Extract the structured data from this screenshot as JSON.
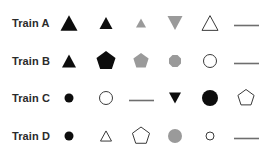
{
  "panel": {
    "name": "marker-legend",
    "background_color": "#ffffff"
  },
  "colors": {
    "black": "#0d0d0d",
    "gray": "#9a9a9a",
    "gray_dark": "#808080",
    "outline": "#3a3a3a",
    "white": "#ffffff",
    "label_text": "#2b2b2b",
    "line_gray": "#6e6e6e"
  },
  "rows": [
    {
      "label": "Train A",
      "markers": [
        {
          "icon": "triangle-up-filled-icon",
          "shape": "triangle-up",
          "fill": "#0d0d0d",
          "stroke": "none",
          "size": 17
        },
        {
          "icon": "triangle-up-filled-icon",
          "shape": "triangle-up",
          "fill": "#0d0d0d",
          "stroke": "none",
          "size": 13
        },
        {
          "icon": "triangle-up-gray-icon",
          "shape": "triangle-up",
          "fill": "#9a9a9a",
          "stroke": "none",
          "size": 10
        },
        {
          "icon": "triangle-down-gray-icon",
          "shape": "triangle-down",
          "fill": "#9a9a9a",
          "stroke": "none",
          "size": 15
        },
        {
          "icon": "triangle-up-outline-icon",
          "shape": "triangle-up",
          "fill": "#ffffff",
          "stroke": "#3a3a3a",
          "size": 16
        },
        {
          "icon": "horizontal-line-icon",
          "shape": "line",
          "fill": "none",
          "stroke": "#6e6e6e",
          "size": 25
        }
      ]
    },
    {
      "label": "Train B",
      "markers": [
        {
          "icon": "triangle-up-filled-icon",
          "shape": "triangle-up",
          "fill": "#0d0d0d",
          "stroke": "none",
          "size": 14
        },
        {
          "icon": "pentagon-filled-icon",
          "shape": "pentagon",
          "fill": "#0d0d0d",
          "stroke": "none",
          "size": 20
        },
        {
          "icon": "pentagon-gray-icon",
          "shape": "pentagon",
          "fill": "#9a9a9a",
          "stroke": "none",
          "size": 16
        },
        {
          "icon": "octagon-gray-icon",
          "shape": "octagon",
          "fill": "#9a9a9a",
          "stroke": "none",
          "size": 13
        },
        {
          "icon": "circle-outline-icon",
          "shape": "circle",
          "fill": "#ffffff",
          "stroke": "#3a3a3a",
          "size": 14
        },
        {
          "icon": "horizontal-line-icon",
          "shape": "line",
          "fill": "none",
          "stroke": "#6e6e6e",
          "size": 25
        }
      ]
    },
    {
      "label": "Train C",
      "markers": [
        {
          "icon": "circle-filled-icon",
          "shape": "circle",
          "fill": "#0d0d0d",
          "stroke": "none",
          "size": 9
        },
        {
          "icon": "circle-outline-icon",
          "shape": "circle",
          "fill": "#ffffff",
          "stroke": "#3a3a3a",
          "size": 14
        },
        {
          "icon": "horizontal-line-icon",
          "shape": "line",
          "fill": "none",
          "stroke": "#6e6e6e",
          "size": 25
        },
        {
          "icon": "triangle-down-filled-icon",
          "shape": "triangle-down",
          "fill": "#0d0d0d",
          "stroke": "none",
          "size": 12
        },
        {
          "icon": "circle-filled-icon",
          "shape": "circle",
          "fill": "#0d0d0d",
          "stroke": "none",
          "size": 16
        },
        {
          "icon": "pentagon-outline-icon",
          "shape": "pentagon",
          "fill": "#ffffff",
          "stroke": "#3a3a3a",
          "size": 17
        }
      ]
    },
    {
      "label": "Train D",
      "markers": [
        {
          "icon": "circle-filled-icon",
          "shape": "circle",
          "fill": "#0d0d0d",
          "stroke": "none",
          "size": 9
        },
        {
          "icon": "triangle-up-outline-icon",
          "shape": "triangle-up",
          "fill": "#ffffff",
          "stroke": "#3a3a3a",
          "size": 11
        },
        {
          "icon": "pentagon-outline-icon",
          "shape": "pentagon",
          "fill": "#ffffff",
          "stroke": "#3a3a3a",
          "size": 18
        },
        {
          "icon": "circle-gray-icon",
          "shape": "circle",
          "fill": "#9a9a9a",
          "stroke": "none",
          "size": 14
        },
        {
          "icon": "circle-outline-small-icon",
          "shape": "circle",
          "fill": "#ffffff",
          "stroke": "#3a3a3a",
          "size": 9
        },
        {
          "icon": "horizontal-line-icon",
          "shape": "line",
          "fill": "none",
          "stroke": "#6e6e6e",
          "size": 25
        }
      ]
    }
  ]
}
